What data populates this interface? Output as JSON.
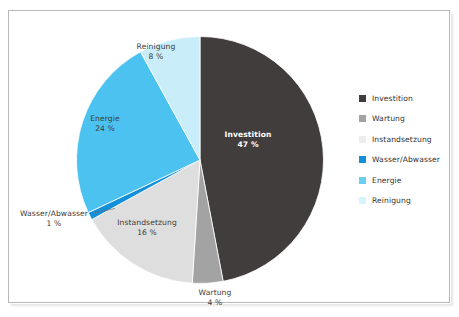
{
  "chart_data": {
    "type": "pie",
    "title": "",
    "xlabel": "",
    "ylabel": "",
    "legend_position": "right",
    "grid": false,
    "start_angle_deg": 0,
    "direction": "clockwise",
    "categories": [
      "Investition",
      "Wartung",
      "Instandsetzung",
      "Wasser/Abwasser",
      "Energie",
      "Reinigung"
    ],
    "values": [
      47,
      4,
      16,
      1,
      24,
      8
    ],
    "value_unit": "%",
    "colors": [
      "#413d3c",
      "#a3a3a3",
      "#dedede",
      "#1490d8",
      "#4cc2f0",
      "#c9eef9"
    ],
    "slices": [
      {
        "label": "Investition",
        "value": 47,
        "value_text": "47 %",
        "color": "#413d3c",
        "label_placement": "inside",
        "label_color": "#ffffff"
      },
      {
        "label": "Wartung",
        "value": 4,
        "value_text": "4 %",
        "color": "#a3a3a3",
        "label_placement": "outside",
        "label_color": "#3b3b3b"
      },
      {
        "label": "Instandsetzung",
        "value": 16,
        "value_text": "16 %",
        "color": "#dedede",
        "label_placement": "inside",
        "label_color": "#3b3b3b"
      },
      {
        "label": "Wasser/Abwasser",
        "value": 1,
        "value_text": "1 %",
        "color": "#1490d8",
        "label_placement": "outside",
        "label_color": "#3b3b3b"
      },
      {
        "label": "Energie",
        "value": 24,
        "value_text": "24 %",
        "color": "#4cc2f0",
        "label_placement": "inside",
        "label_color": "#3b3b3b"
      },
      {
        "label": "Reinigung",
        "value": 8,
        "value_text": "8 %",
        "color": "#c9eef9",
        "label_placement": "inside",
        "label_color": "#3b3b3b"
      }
    ]
  },
  "labels": {
    "investition": {
      "name": "Investition",
      "value": "47 %"
    },
    "wartung": {
      "name": "Wartung",
      "value": "4 %"
    },
    "instandsetzung": {
      "name": "Instandsetzung",
      "value": "16 %"
    },
    "wasser": {
      "name": "Wasser/Abwasser",
      "value": "1 %"
    },
    "energie": {
      "name": "Energie",
      "value": "24 %"
    },
    "reinigung": {
      "name": "Reinigung",
      "value": "8 %"
    }
  },
  "legend": {
    "items": [
      {
        "label": "Investition",
        "color": "#413d3c"
      },
      {
        "label": "Wartung",
        "color": "#a3a3a3"
      },
      {
        "label": "Instandsetzung",
        "color": "#ededed"
      },
      {
        "label": "Wasser/Abwasser",
        "color": "#1490d8"
      },
      {
        "label": "Energie",
        "color": "#6ccdf2"
      },
      {
        "label": "Reinigung",
        "color": "#d8f3fb"
      }
    ]
  },
  "caption": {
    "text": ""
  }
}
